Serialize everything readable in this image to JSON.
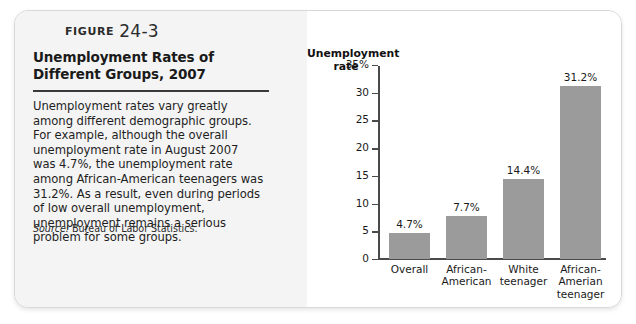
{
  "figure": {
    "label_word": "Figure",
    "number": "24-3",
    "title": "Unemployment Rates of Different Groups, 2007",
    "body": "Unemployment rates vary greatly among different demographic groups. For example, although the overall unemployment rate in August 2007 was 4.7%, the unemployment rate among African-American teenagers was 31.2%. As a result, even during periods of low overall unemployment, unemployment remains a serious problem for some groups.",
    "source_label": "Source:",
    "source_text": "Bureau of Labor Statistics."
  },
  "chart_data": {
    "type": "bar",
    "title": "",
    "xlabel": "",
    "ylabel": "Unemployment rate",
    "ylim": [
      0,
      35
    ],
    "grid": false,
    "legend": false,
    "categories": [
      "Overall",
      "African-American",
      "White teenager",
      "African-Amerian teenager"
    ],
    "category_lines": [
      [
        "Overall"
      ],
      [
        "African-",
        "American"
      ],
      [
        "White",
        "teenager"
      ],
      [
        "African-",
        "Amerian",
        "teenager"
      ]
    ],
    "values": [
      4.7,
      7.7,
      14.4,
      31.2
    ],
    "value_labels": [
      "4.7%",
      "7.7%",
      "14.4%",
      "31.2%"
    ],
    "tick_labels": [
      "35%",
      "30",
      "25",
      "20",
      "15",
      "10",
      "5",
      "0"
    ],
    "tick_values": [
      35,
      30,
      25,
      20,
      15,
      10,
      5,
      0
    ],
    "bar_color": "#9b9b9b",
    "axis_color": "#4a4a4a",
    "panel_color": "#ffffff"
  }
}
